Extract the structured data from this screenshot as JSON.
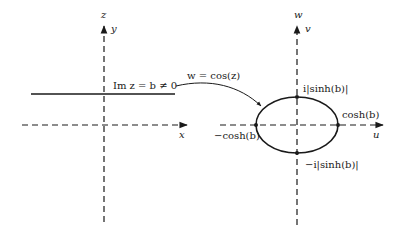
{
  "z_plane": {
    "plane_label": "z",
    "vertical_axis_label": "y",
    "horizontal_axis_label": "x",
    "line_label": "Im z = b ≠ 0"
  },
  "mapping": {
    "label": "w = cos(z)"
  },
  "w_plane": {
    "plane_label": "w",
    "vertical_axis_label": "v",
    "horizontal_axis_label": "u",
    "ellipse_points": {
      "top": "i|sinh(b)|",
      "bottom": "−i|sinh(b)|",
      "right": "cosh(b)",
      "left": "−cosh(b)"
    }
  },
  "colors": {
    "ink": "#1a1a1a",
    "background": "#ffffff"
  }
}
